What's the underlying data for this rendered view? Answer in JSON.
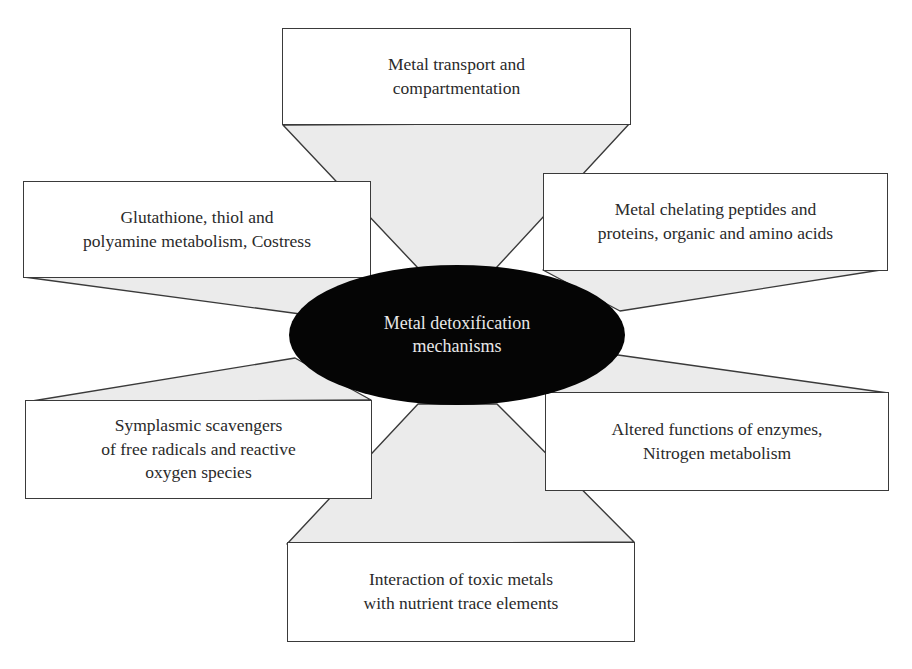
{
  "diagram": {
    "type": "hub-and-spoke",
    "center": {
      "label": "Metal detoxification\nmechanisms",
      "fill": "#050505",
      "text_color": "#e8e8e8"
    },
    "nodes": [
      {
        "id": "top",
        "label": "Metal transport and\ncompartmentation"
      },
      {
        "id": "upper-left",
        "label": "Glutathione, thiol and\npolyamine metabolism, Costress"
      },
      {
        "id": "upper-right",
        "label": "Metal chelating peptides and\nproteins, organic and amino acids"
      },
      {
        "id": "lower-left",
        "label": "Symplasmic scavengers\nof free radicals and reactive\noxygen species"
      },
      {
        "id": "lower-right",
        "label": "Altered functions of enzymes,\nNitrogen metabolism"
      },
      {
        "id": "bottom",
        "label": "Interaction of toxic metals\nwith nutrient trace elements"
      }
    ],
    "edges": [
      {
        "from": "center",
        "to": "top"
      },
      {
        "from": "center",
        "to": "upper-left"
      },
      {
        "from": "center",
        "to": "upper-right"
      },
      {
        "from": "center",
        "to": "lower-left"
      },
      {
        "from": "center",
        "to": "lower-right"
      },
      {
        "from": "center",
        "to": "bottom"
      }
    ],
    "colors": {
      "connector_fill": "#ebebeb",
      "border": "#3a3a3a",
      "box_fill": "#ffffff"
    }
  }
}
